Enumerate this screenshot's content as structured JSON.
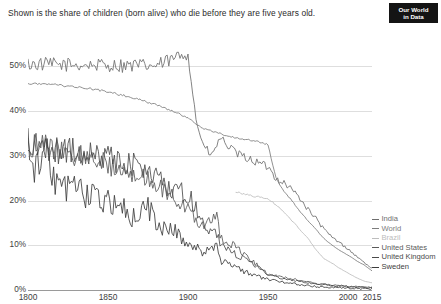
{
  "subtitle": "Shown is the share of children (born alive) who die before they are five years old.",
  "logo": {
    "line1": "Our World",
    "line2": "in Data"
  },
  "caption": "",
  "chart_data": {
    "type": "line",
    "title": "",
    "subtitle": "Shown is the share of children (born alive) who die before they are five years old.",
    "xlabel": "",
    "ylabel": "",
    "xlim": [
      1800,
      2015
    ],
    "ylim": [
      0,
      55
    ],
    "grid": true,
    "legend_position": "right",
    "y_ticks": [
      "0%",
      "10%",
      "20%",
      "30%",
      "40%",
      "50%"
    ],
    "y_tick_values": [
      0,
      10,
      20,
      30,
      40,
      50
    ],
    "x_ticks": [
      "1800",
      "1850",
      "1900",
      "1950",
      "2000",
      "2015"
    ],
    "x_tick_values": [
      1800,
      1850,
      1900,
      1950,
      2000,
      2015
    ],
    "series": [
      {
        "name": "India",
        "color": "#6e6e6e",
        "x": [
          1800,
          1820,
          1840,
          1860,
          1880,
          1890,
          1900,
          1905,
          1910,
          1915,
          1920,
          1930,
          1940,
          1950,
          1955,
          1960,
          1965,
          1970,
          1975,
          1980,
          1985,
          1990,
          1995,
          2000,
          2005,
          2010,
          2015
        ],
        "values": [
          50.5,
          50.4,
          50.3,
          50.2,
          50.1,
          51.5,
          53.2,
          38.0,
          32.0,
          30.0,
          34.0,
          30.5,
          29.0,
          27.5,
          25.0,
          24.0,
          22.5,
          20.5,
          18.0,
          16.0,
          13.5,
          11.8,
          10.5,
          9.2,
          7.6,
          6.2,
          4.8
        ]
      },
      {
        "name": "World",
        "color": "#7d7d7d",
        "x": [
          1800,
          1820,
          1840,
          1860,
          1880,
          1900,
          1910,
          1920,
          1930,
          1940,
          1950,
          1955,
          1960,
          1965,
          1970,
          1975,
          1980,
          1985,
          1990,
          1995,
          2000,
          2005,
          2010,
          2015
        ],
        "values": [
          46.2,
          45.8,
          45.0,
          43.5,
          41.5,
          38.5,
          36.0,
          35.0,
          34.0,
          33.5,
          32.5,
          25.0,
          22.0,
          20.0,
          17.5,
          15.5,
          13.5,
          11.5,
          10.0,
          8.8,
          7.8,
          6.6,
          5.6,
          4.3
        ]
      },
      {
        "name": "Brazil",
        "color": "#bdbdbd",
        "x": [
          1930,
          1940,
          1950,
          1960,
          1970,
          1975,
          1980,
          1985,
          1990,
          1995,
          2000,
          2005,
          2010,
          2015
        ],
        "values": [
          22.0,
          21.0,
          20.5,
          17.5,
          13.5,
          11.5,
          9.0,
          7.0,
          6.0,
          4.8,
          3.8,
          2.8,
          2.0,
          1.6
        ]
      },
      {
        "name": "United States",
        "color": "#5a5a5a",
        "x": [
          1800,
          1810,
          1820,
          1830,
          1840,
          1850,
          1860,
          1870,
          1880,
          1890,
          1900,
          1910,
          1918,
          1920,
          1930,
          1940,
          1950,
          1960,
          1970,
          1980,
          1990,
          2000,
          2010,
          2015
        ],
        "values": [
          32.9,
          32.0,
          31.0,
          30.2,
          29.5,
          28.0,
          27.0,
          25.5,
          23.5,
          21.0,
          18.0,
          14.0,
          16.5,
          12.0,
          9.5,
          6.5,
          3.5,
          2.8,
          2.2,
          1.4,
          1.1,
          0.85,
          0.7,
          0.65
        ]
      },
      {
        "name": "United Kingdom",
        "color": "#4a4a4a",
        "x": [
          1800,
          1810,
          1820,
          1830,
          1840,
          1850,
          1860,
          1870,
          1880,
          1890,
          1900,
          1910,
          1918,
          1920,
          1930,
          1940,
          1950,
          1960,
          1970,
          1980,
          1990,
          2000,
          2010,
          2015
        ],
        "values": [
          32.9,
          31.5,
          30.8,
          31.0,
          30.0,
          29.5,
          28.5,
          28.0,
          25.0,
          22.5,
          21.5,
          14.5,
          13.0,
          10.5,
          8.0,
          6.0,
          3.4,
          2.5,
          1.9,
          1.4,
          0.95,
          0.72,
          0.52,
          0.43
        ]
      },
      {
        "name": "Sweden",
        "color": "#3c3c3c",
        "x": [
          1800,
          1805,
          1810,
          1815,
          1820,
          1825,
          1830,
          1835,
          1840,
          1845,
          1850,
          1855,
          1860,
          1865,
          1870,
          1875,
          1880,
          1885,
          1890,
          1895,
          1900,
          1910,
          1918,
          1920,
          1930,
          1940,
          1950,
          1960,
          1970,
          1980,
          1990,
          2000,
          2010,
          2015
        ],
        "values": [
          32.5,
          27.0,
          33.5,
          24.0,
          25.5,
          22.5,
          25.0,
          20.5,
          22.0,
          19.0,
          20.5,
          18.5,
          18.0,
          16.5,
          17.0,
          19.0,
          15.0,
          14.0,
          13.5,
          12.0,
          11.0,
          8.5,
          9.5,
          6.5,
          5.0,
          3.5,
          2.3,
          1.7,
          1.2,
          0.8,
          0.65,
          0.4,
          0.3,
          0.28
        ]
      }
    ],
    "legend": [
      {
        "label": "India",
        "color": "#6e6e6e",
        "y_pct": 5.0
      },
      {
        "label": "World",
        "color": "#7d7d7d",
        "y_pct": 4.3
      },
      {
        "label": "Brazil",
        "color": "#bdbdbd",
        "y_pct": 1.6
      },
      {
        "label": "United States",
        "color": "#5a5a5a",
        "y_pct": 0.65
      },
      {
        "label": "United Kingdom",
        "color": "#4a4a4a",
        "y_pct": 0.43
      },
      {
        "label": "Sweden",
        "color": "#3c3c3c",
        "y_pct": 0.28
      }
    ]
  }
}
